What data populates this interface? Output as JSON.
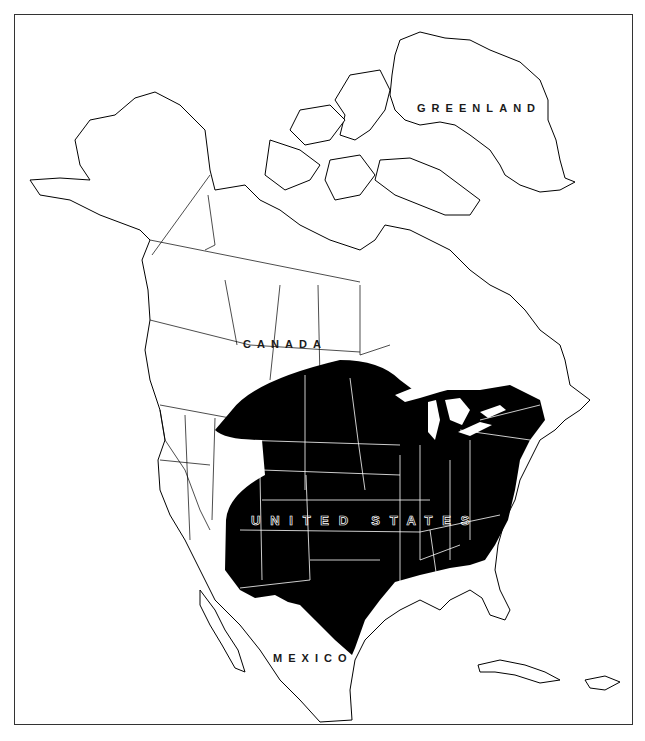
{
  "map": {
    "title": "",
    "style": {
      "land_fill": "#ffffff",
      "outline_color": "#000000",
      "range_fill": "#000000",
      "range_border_color": "#ffffff",
      "frame_color": "#333333"
    },
    "labels": {
      "greenland": "GREENLAND",
      "canada": "CANADA",
      "united_states": "UNITED STATES",
      "mexico": "MEXICO"
    },
    "range": {
      "description": "Shaded distribution covering central and eastern United States",
      "color": "#000000"
    }
  }
}
